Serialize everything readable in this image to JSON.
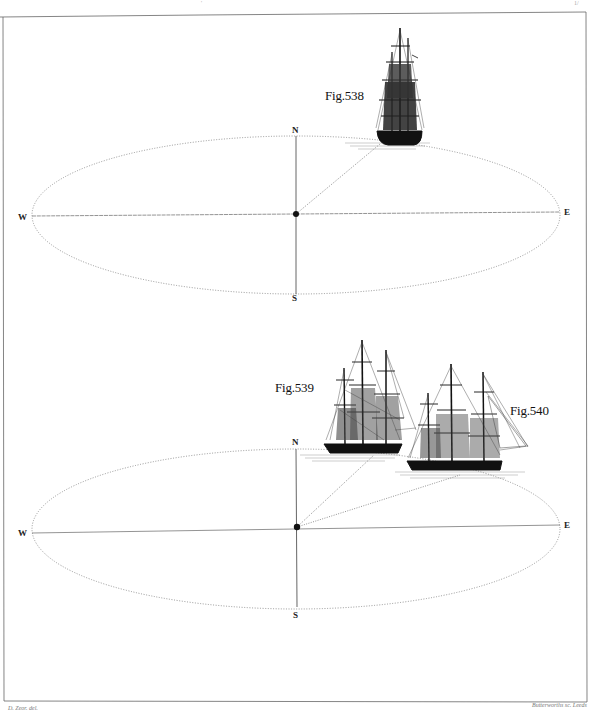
{
  "plate": {
    "page_marks": {
      "top_center": "'",
      "top_right": "1/"
    },
    "credits": {
      "left": "D. Zeor. del.",
      "right": "Butterworths sc. Leeds"
    },
    "colors": {
      "ink": "#1a1a1a",
      "line": "#555555",
      "dotted": "#888888",
      "paper": "#ffffff",
      "border": "#666666"
    }
  },
  "diagrams": [
    {
      "id": "top",
      "figures": [
        {
          "label": "Fig.538",
          "ship": "full-rigged ship, bow view"
        }
      ],
      "compass": {
        "north": "N",
        "south": "S",
        "west": "W",
        "east": "E"
      },
      "center": [
        296,
        214
      ],
      "ellipse": {
        "cx": 296,
        "cy": 215,
        "rx": 264,
        "ry": 79
      },
      "sight_lines": [
        {
          "to": [
            378,
            142
          ]
        }
      ]
    },
    {
      "id": "bottom",
      "figures": [
        {
          "label": "Fig.539",
          "ship": "three-masted ship, broadside"
        },
        {
          "label": "Fig.540",
          "ship": "three-masted frigate, broadside"
        }
      ],
      "compass": {
        "north": "N",
        "south": "S",
        "west": "W",
        "east": "E"
      },
      "center": [
        297,
        527
      ],
      "ellipse": {
        "cx": 296,
        "cy": 529,
        "rx": 264,
        "ry": 80
      },
      "sight_lines": [
        {
          "to": [
            372,
            452
          ]
        },
        {
          "to": [
            460,
            474
          ]
        }
      ]
    }
  ]
}
